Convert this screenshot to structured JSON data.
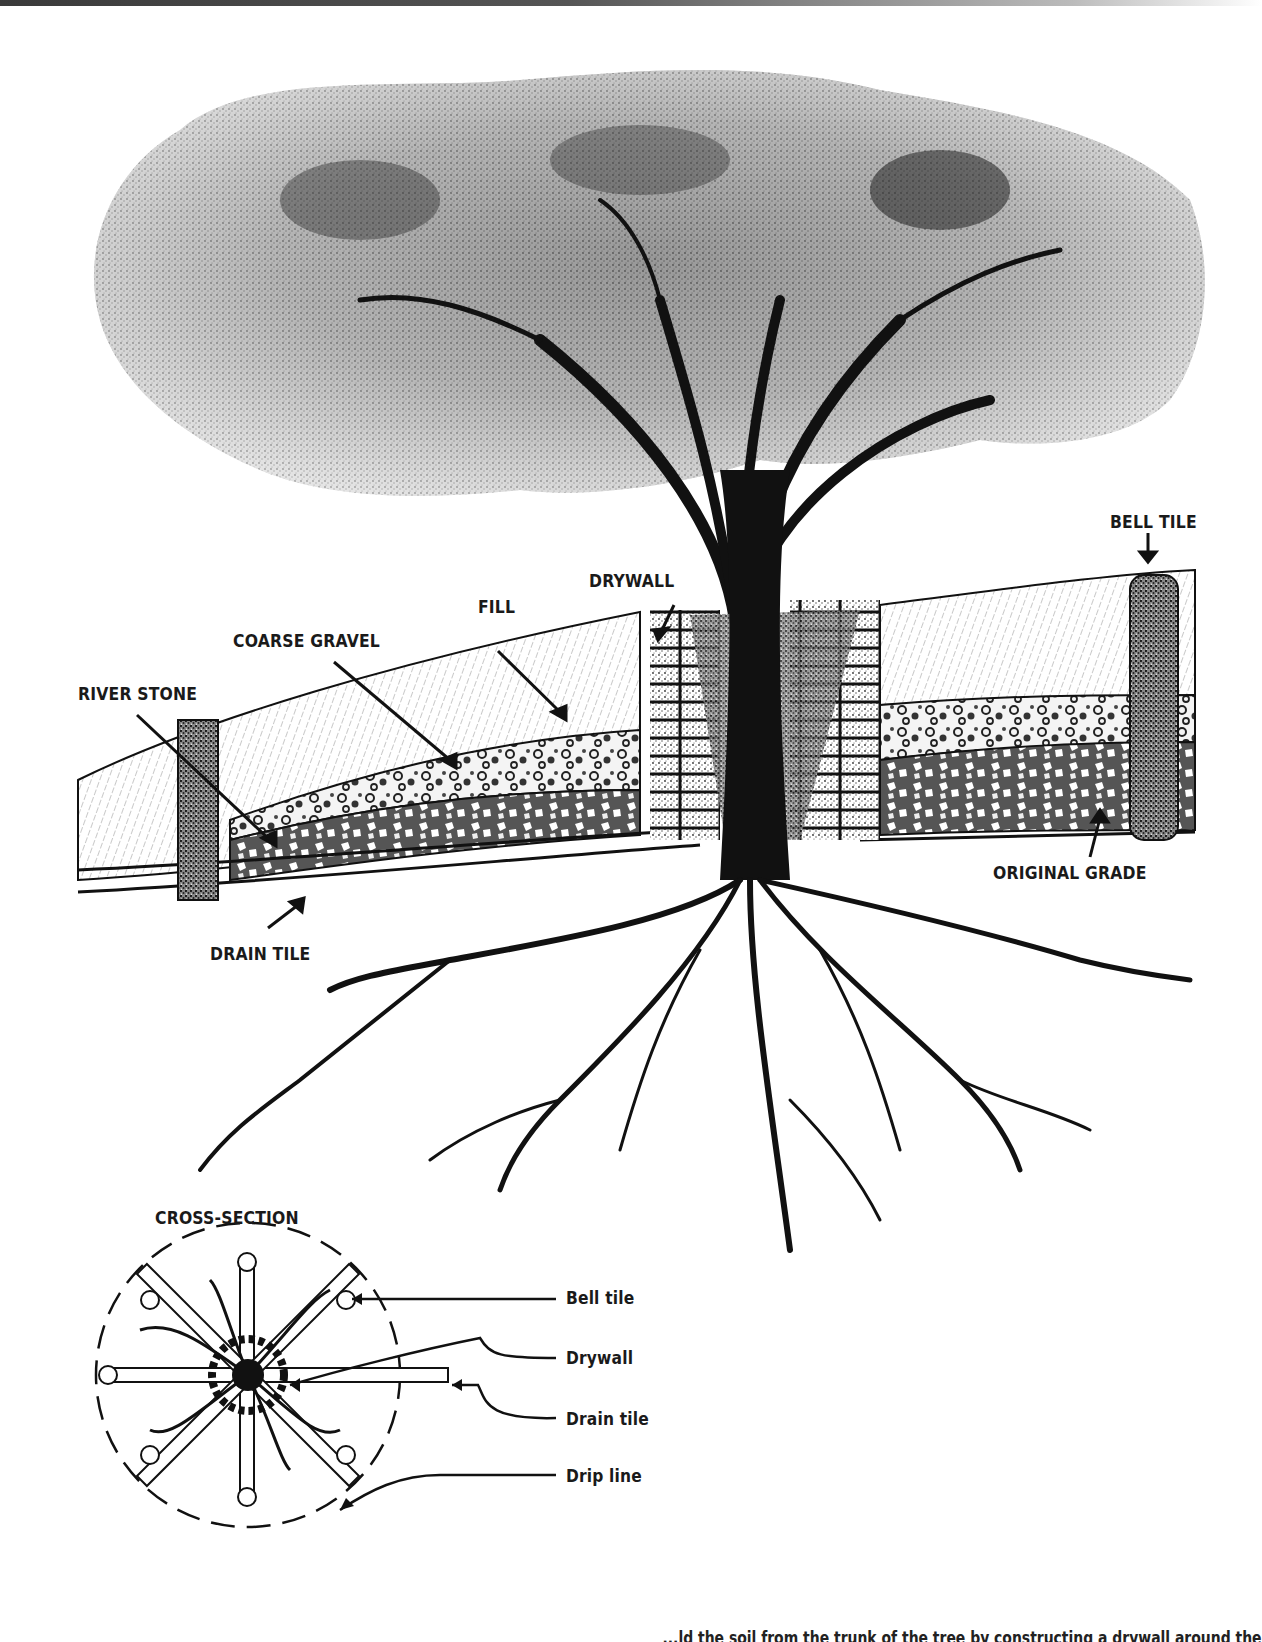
{
  "figure": {
    "type": "tree-drywall-drainage-illustration",
    "main_labels": {
      "bell_tile": "BELL TILE",
      "drywall": "DRYWALL",
      "fill": "FILL",
      "coarse_gravel": "COARSE GRAVEL",
      "river_stone": "RIVER STONE",
      "original_grade": "ORIGINAL GRADE",
      "drain_tile": "DRAIN TILE"
    },
    "cross_section": {
      "title": "CROSS-SECTION",
      "legend": [
        {
          "label": "Bell tile"
        },
        {
          "label": "Drywall"
        },
        {
          "label": "Drain tile"
        },
        {
          "label": "Drip line"
        }
      ]
    },
    "caption_partial": "...ld the soil from the trunk of the tree by constructing a drywall around the"
  },
  "colors": {
    "ink": "#1a1a1a",
    "paper": "#ffffff",
    "stipple": "#444444"
  }
}
